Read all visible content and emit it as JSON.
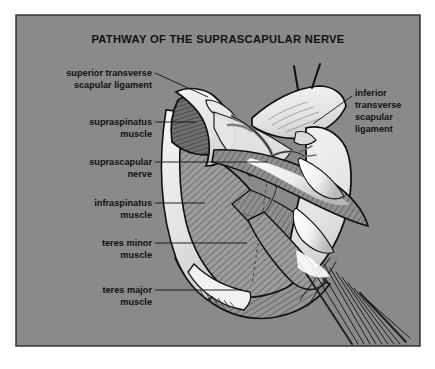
{
  "figure": {
    "title": "PATHWAY OF THE SUPRASCAPULAR NERVE",
    "panel": {
      "background_color": "#8a8a8a",
      "border_color": "#2a2a2a",
      "outer_margin_color": "#ffffff"
    },
    "colors": {
      "bone_light": "#efefef",
      "bone_shadow": "#d8d8d8",
      "muscle_mid": "#9a9a9a",
      "muscle_dark": "#6f6f6f",
      "outline": "#111111",
      "hatch": "#3c3c3c",
      "tendon_white": "#fbfbfb",
      "nerve": "#8e8e8e",
      "label_text": "#111111"
    },
    "labels_left": [
      {
        "id": "superior-transverse-scapular-ligament",
        "lines": [
          "superior transverse",
          "scapular ligament"
        ],
        "anchor_x": 152,
        "anchor_y": 76,
        "leader_to_x": 208,
        "leader_to_y": 97
      },
      {
        "id": "supraspinatus-muscle",
        "lines": [
          "supraspinatus",
          "muscle"
        ],
        "anchor_x": 152,
        "anchor_y": 122,
        "leader_to_x": 196,
        "leader_to_y": 122
      },
      {
        "id": "suprascapular-nerve",
        "lines": [
          "suprascapular",
          "nerve"
        ],
        "anchor_x": 152,
        "anchor_y": 162,
        "leader_to_x": 268,
        "leader_to_y": 162
      },
      {
        "id": "infraspinatus-muscle",
        "lines": [
          "infraspinatus",
          "muscle"
        ],
        "anchor_x": 152,
        "anchor_y": 203,
        "leader_to_x": 205,
        "leader_to_y": 203
      },
      {
        "id": "teres-minor-muscle",
        "lines": [
          "teres minor",
          "muscle"
        ],
        "anchor_x": 152,
        "anchor_y": 243,
        "leader_to_x": 247,
        "leader_to_y": 243
      },
      {
        "id": "teres-major-muscle",
        "lines": [
          "teres major",
          "muscle"
        ],
        "anchor_x": 152,
        "anchor_y": 290,
        "leader_to_x": 242,
        "leader_to_y": 290
      }
    ],
    "labels_right": [
      {
        "id": "inferior-transverse-scapular-ligament",
        "lines": [
          "inferior",
          "transverse",
          "scapular",
          "ligament"
        ],
        "anchor_x": 355,
        "anchor_y": 93,
        "leader_to_x": 313,
        "leader_to_y": 124
      }
    ],
    "structures": [
      {
        "name": "supraspinatus-muscle",
        "tone": "muscle-dark-hatched"
      },
      {
        "name": "scapular-spine",
        "tone": "bone-light"
      },
      {
        "name": "infraspinatus-muscle",
        "tone": "muscle-mid-hatched"
      },
      {
        "name": "teres-minor-muscle",
        "tone": "muscle-mid-hatched"
      },
      {
        "name": "teres-major-muscle",
        "tone": "muscle-mid-hatched"
      },
      {
        "name": "acromion",
        "tone": "bone-light"
      },
      {
        "name": "clavicle-stumps",
        "tone": "bone-light"
      },
      {
        "name": "humerus",
        "tone": "bone-light"
      },
      {
        "name": "suprascapular-nerve",
        "tone": "nerve"
      },
      {
        "name": "superior-transverse-scapular-ligament",
        "tone": "ligament"
      },
      {
        "name": "inferior-transverse-scapular-ligament",
        "tone": "ligament"
      },
      {
        "name": "triceps-long-head",
        "tone": "muscle-mid-hatched"
      }
    ]
  }
}
